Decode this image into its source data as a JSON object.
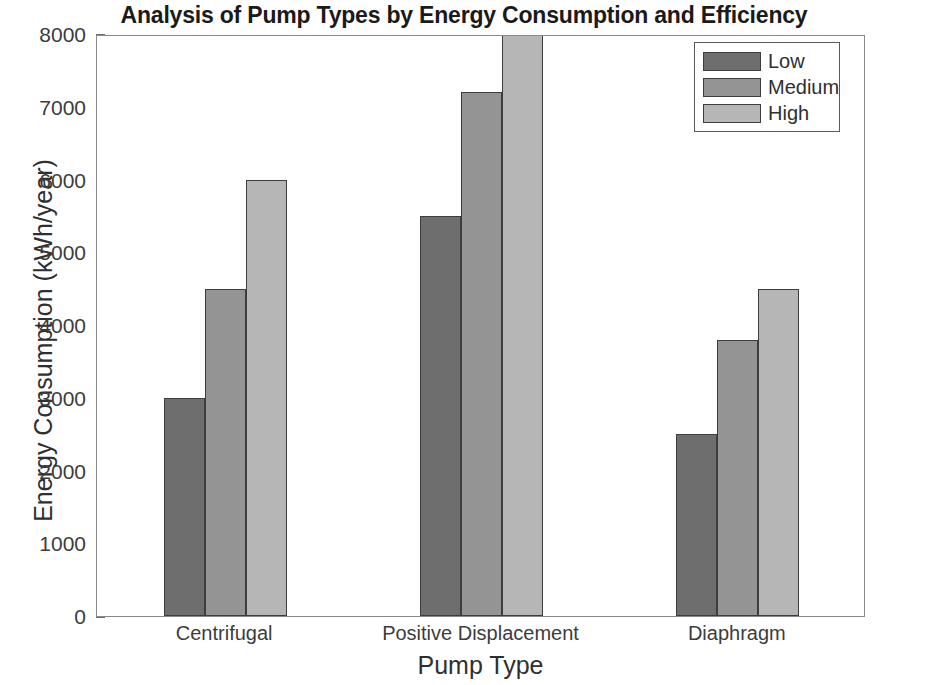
{
  "chart_data": {
    "type": "bar",
    "title": "Analysis of Pump Types by Energy Consumption and Efficiency",
    "xlabel": "Pump Type",
    "ylabel": "Energy Consumption (kWh/year)",
    "categories": [
      "Centrifugal",
      "Positive Displacement",
      "Diaphragm"
    ],
    "series": [
      {
        "name": "Low",
        "values": [
          3000,
          5500,
          2500
        ],
        "color": "#6e6e6e"
      },
      {
        "name": "Medium",
        "values": [
          4500,
          7200,
          3800
        ],
        "color": "#949494"
      },
      {
        "name": "High",
        "values": [
          6000,
          8000,
          4500
        ],
        "color": "#b6b6b6"
      }
    ],
    "ylim": [
      0,
      8000
    ],
    "yticks": [
      0,
      1000,
      2000,
      3000,
      4000,
      5000,
      6000,
      7000,
      8000
    ],
    "ytick_labels": [
      "0",
      "1000",
      "2000",
      "3000",
      "4000",
      "5000",
      "6000",
      "7000",
      "8000"
    ],
    "grid": false,
    "legend_position": "top-right",
    "bar_edge_color": "#3d3d3d",
    "axis_color": "#8a8a8a"
  },
  "legend": {
    "entries": [
      {
        "label": "Low"
      },
      {
        "label": "Medium"
      },
      {
        "label": "High"
      }
    ]
  }
}
